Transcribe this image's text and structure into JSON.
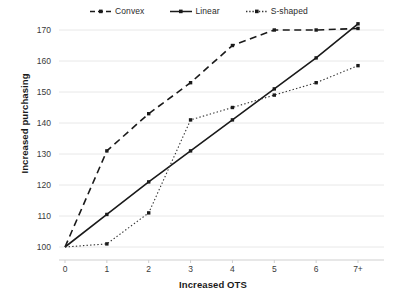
{
  "chart_data": {
    "type": "line",
    "title": "",
    "xlabel": "Increased OTS",
    "ylabel": "Increased purchasing",
    "categories": [
      "0",
      "1",
      "2",
      "3",
      "4",
      "5",
      "6",
      "7+"
    ],
    "x_tick_labels": [
      "0",
      "1",
      "2",
      "3",
      "4",
      "5",
      "6",
      "7+"
    ],
    "y_tick_labels": [
      "100",
      "110",
      "120",
      "130",
      "140",
      "150",
      "160",
      "170"
    ],
    "xlim": [
      0,
      7
    ],
    "ylim": [
      100,
      174
    ],
    "grid": "horizontal",
    "legend_position": "top-center",
    "series": [
      {
        "name": "Convex",
        "style": "dashed",
        "color": "#1a1a1a",
        "values": [
          100,
          131,
          143,
          153,
          165,
          170,
          170,
          170.5
        ]
      },
      {
        "name": "Linear",
        "style": "solid",
        "color": "#1a1a1a",
        "values": [
          100,
          110.5,
          121,
          131,
          141,
          151,
          161,
          172
        ]
      },
      {
        "name": "S-shaped",
        "style": "dotted",
        "color": "#333333",
        "values": [
          100,
          101,
          111,
          141,
          145,
          149,
          153,
          158.5
        ]
      }
    ]
  },
  "legend": {
    "entries": [
      {
        "label": "Convex"
      },
      {
        "label": "Linear"
      },
      {
        "label": "S-shaped"
      }
    ]
  },
  "axes": {
    "y_title": "Increased purchasing",
    "x_title": "Increased OTS"
  },
  "colors": {
    "ink": "#1a1a1a",
    "gridline": "#e8e8e8",
    "axis": "#cfcfcf",
    "background": "#ffffff"
  }
}
